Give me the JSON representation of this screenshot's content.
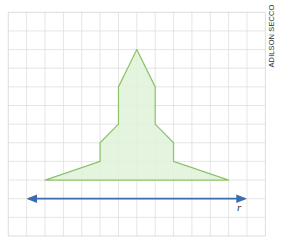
{
  "figure": {
    "grid": {
      "x0": 8.3,
      "y0": 12.3,
      "cols": 14,
      "rows": 12,
      "cell_w": 18.36,
      "cell_h": 18.64,
      "line_color": "#dedede",
      "border_color": "#d4d4d4"
    },
    "polygon": {
      "fill": "#dff2d8",
      "fill_opacity": 0.85,
      "stroke": "#8dc26b",
      "vertices_grid": [
        [
          7,
          2
        ],
        [
          8,
          4
        ],
        [
          8,
          6
        ],
        [
          9,
          7
        ],
        [
          9,
          8
        ],
        [
          12,
          9
        ],
        [
          2,
          9
        ],
        [
          5,
          8
        ],
        [
          5,
          7
        ],
        [
          6,
          6
        ],
        [
          6,
          4
        ]
      ]
    },
    "line_r": {
      "label": "r",
      "color": "#3a6db0",
      "from_grid": [
        1,
        10
      ],
      "to_grid": [
        13,
        10
      ],
      "arrows": "both"
    },
    "credit": "ADILSON SECCO"
  }
}
